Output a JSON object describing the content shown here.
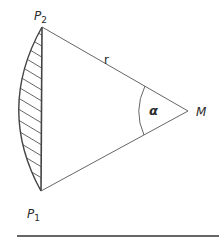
{
  "diagram": {
    "type": "circular-segment",
    "points": {
      "P1": {
        "label": "P",
        "sub": "1",
        "x": 41,
        "y": 191
      },
      "P2": {
        "label": "P",
        "sub": "2",
        "x": 42,
        "y": 27
      },
      "M": {
        "label": "M",
        "x": 188,
        "y": 111
      }
    },
    "radius_label": "r",
    "angle_label": "α",
    "segment_fill": "hatched",
    "colors": {
      "line": "#555555",
      "text": "#2a2a2a",
      "rule": "#333333",
      "background": "#ffffff"
    }
  }
}
